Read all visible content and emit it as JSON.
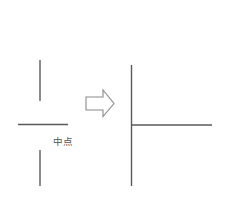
{
  "canvas": {
    "width": 234,
    "height": 205,
    "background": "#ffffff"
  },
  "style": {
    "line_color": "#5a5a5a",
    "line_color_dark": "#4a4a4a",
    "text_color": "#555555",
    "arrow_stroke": "#8a8a8a",
    "arrow_fill": "#ffffff",
    "line_width": 1.4,
    "arrow_line_width": 1.1,
    "label_font_size": 9.5
  },
  "labels": {
    "midpoint": "中点"
  },
  "chart_data": {
    "type": "diagram",
    "title": "",
    "annotations": [
      {
        "name": "midpoint-label",
        "text": "中点",
        "x": 53,
        "y": 145
      }
    ],
    "shapes": [
      {
        "name": "left-upper-vertical-segment",
        "type": "line",
        "x1": 40,
        "y1": 60,
        "x2": 40,
        "y2": 101
      },
      {
        "name": "left-horizontal-segment",
        "type": "line",
        "x1": 18,
        "y1": 124.5,
        "x2": 68,
        "y2": 124.5
      },
      {
        "name": "left-lower-vertical-segment",
        "type": "line",
        "x1": 40,
        "y1": 150,
        "x2": 40,
        "y2": 186
      },
      {
        "name": "transform-arrow",
        "type": "polygon",
        "points": "86,97 103,97 103,90 114,103.5 103,116.5 103,110 86,110"
      },
      {
        "name": "right-vertical-line",
        "type": "line",
        "x1": 131.5,
        "y1": 65,
        "x2": 131.5,
        "y2": 186
      },
      {
        "name": "right-horizontal-line",
        "type": "line",
        "x1": 131.5,
        "y1": 125,
        "x2": 212,
        "y2": 125
      }
    ]
  }
}
